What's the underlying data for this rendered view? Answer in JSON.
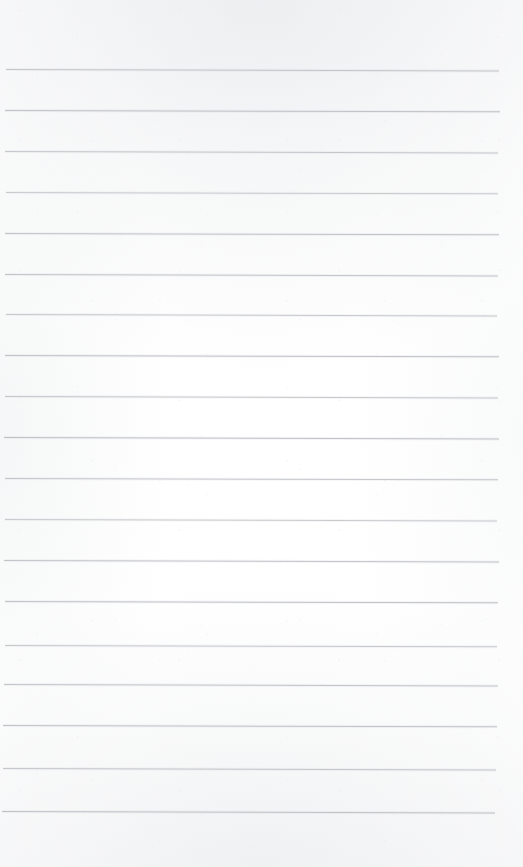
{
  "document": {
    "kind": "scanned-ruled-notebook-page",
    "title": "Blank lined notebook page",
    "page_width": 523,
    "page_height": 867,
    "background_color": "#fdfdfd",
    "has_text_content": false,
    "written_content": "",
    "margin_top": 70,
    "margin_bottom": 55
  },
  "ruling": {
    "line_color": "#b9bdc2",
    "line_thickness": 1,
    "line_spacing": 41,
    "line_count": 19,
    "left_inset": 5,
    "right_inset": 25,
    "slope_degrees": 0.16,
    "lines": [
      {
        "y": 69,
        "left": 6,
        "right": 499,
        "opacity": 0.82,
        "slope": 0.16
      },
      {
        "y": 110,
        "left": 5,
        "right": 500,
        "opacity": 0.88,
        "slope": 0.15
      },
      {
        "y": 151,
        "left": 5,
        "right": 498,
        "opacity": 0.8,
        "slope": 0.17
      },
      {
        "y": 192,
        "left": 6,
        "right": 498,
        "opacity": 0.74,
        "slope": 0.16
      },
      {
        "y": 233,
        "left": 5,
        "right": 499,
        "opacity": 0.86,
        "slope": 0.15
      },
      {
        "y": 274,
        "left": 5,
        "right": 498,
        "opacity": 0.84,
        "slope": 0.16
      },
      {
        "y": 314,
        "left": 6,
        "right": 497,
        "opacity": 0.78,
        "slope": 0.17
      },
      {
        "y": 355,
        "left": 5,
        "right": 499,
        "opacity": 0.88,
        "slope": 0.15
      },
      {
        "y": 396,
        "left": 5,
        "right": 498,
        "opacity": 0.8,
        "slope": 0.16
      },
      {
        "y": 437,
        "left": 4,
        "right": 499,
        "opacity": 0.9,
        "slope": 0.16
      },
      {
        "y": 478,
        "left": 5,
        "right": 498,
        "opacity": 0.82,
        "slope": 0.15
      },
      {
        "y": 519,
        "left": 5,
        "right": 497,
        "opacity": 0.76,
        "slope": 0.17
      },
      {
        "y": 560,
        "left": 4,
        "right": 499,
        "opacity": 0.86,
        "slope": 0.16
      },
      {
        "y": 601,
        "left": 5,
        "right": 498,
        "opacity": 0.88,
        "slope": 0.15
      },
      {
        "y": 645,
        "left": 5,
        "right": 497,
        "opacity": 0.78,
        "slope": 0.16
      },
      {
        "y": 684,
        "left": 4,
        "right": 498,
        "opacity": 0.84,
        "slope": 0.16
      },
      {
        "y": 725,
        "left": 3,
        "right": 497,
        "opacity": 0.86,
        "slope": 0.15
      },
      {
        "y": 768,
        "left": 3,
        "right": 496,
        "opacity": 0.82,
        "slope": 0.16
      },
      {
        "y": 811,
        "left": 2,
        "right": 495,
        "opacity": 0.88,
        "slope": 0.17
      }
    ]
  }
}
